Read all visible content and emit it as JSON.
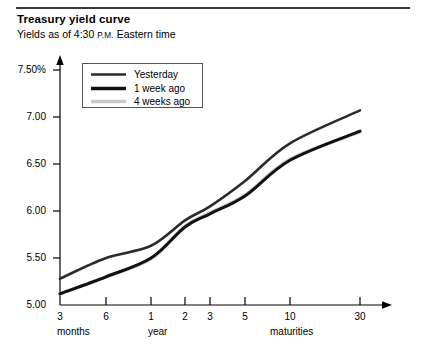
{
  "header": {
    "title": "Treasury yield curve",
    "subtitle_pre": "Yields as of 4:30 ",
    "subtitle_sc": "P.M.",
    "subtitle_post": " Eastern time"
  },
  "legend": {
    "items": [
      {
        "label": "Yesterday",
        "color": "#2b2b2b",
        "width": 2.6
      },
      {
        "label": "1 week ago",
        "color": "#111111",
        "width": 3.4
      },
      {
        "label": "4 weeks ago",
        "color": "#c9c9c9",
        "width": 3.4
      }
    ]
  },
  "axis": {
    "y_ticks": [
      "7.50%",
      "7.00",
      "6.50",
      "6.00",
      "5.50",
      "5.00"
    ],
    "x_ticks": [
      "3",
      "6",
      "1",
      "2",
      "3",
      "5",
      "10",
      "30"
    ],
    "x_groups": [
      "months",
      "year",
      "maturities"
    ]
  },
  "chart_data": {
    "type": "line",
    "title": "Treasury yield curve",
    "subtitle": "Yields as of 4:30 P.M. Eastern time",
    "xlabel": "",
    "ylabel": "",
    "ylim": [
      5.0,
      7.5
    ],
    "ytick_values": [
      7.5,
      7.0,
      6.5,
      6.0,
      5.5,
      5.0
    ],
    "ytick_labels": [
      "7.50%",
      "7.00",
      "6.50",
      "6.00",
      "5.50",
      "5.00"
    ],
    "grid": false,
    "legend_position": "upper-left-inside",
    "categories": [
      "3 months",
      "6 months",
      "1 year",
      "2 year",
      "3 year",
      "5 year",
      "10 year",
      "30 year"
    ],
    "x_tick_labels": [
      "3",
      "6",
      "1",
      "2",
      "3",
      "5",
      "10",
      "30"
    ],
    "x_group_labels": [
      "months",
      "year",
      "maturities"
    ],
    "series": [
      {
        "name": "Yesterday",
        "color": "#2b2b2b",
        "values": [
          5.28,
          5.5,
          5.63,
          5.9,
          6.05,
          6.32,
          6.72,
          7.07
        ]
      },
      {
        "name": "1 week ago",
        "color": "#111111",
        "values": [
          5.12,
          5.3,
          5.5,
          5.83,
          5.97,
          6.16,
          6.54,
          6.85
        ]
      },
      {
        "name": "4 weeks ago",
        "color": "#c9c9c9",
        "values": [
          5.12,
          5.3,
          5.49,
          5.84,
          5.98,
          6.17,
          6.55,
          6.84
        ]
      }
    ]
  },
  "plot_geometry": {
    "x_pixels": [
      60,
      106,
      151,
      185,
      210,
      245,
      290,
      360
    ],
    "y_pixels_for_value": {
      "5.00": 305,
      "7.50": 70
    },
    "axis_x0": 60,
    "axis_y0": 305,
    "axis_arrow_x": 392
  }
}
